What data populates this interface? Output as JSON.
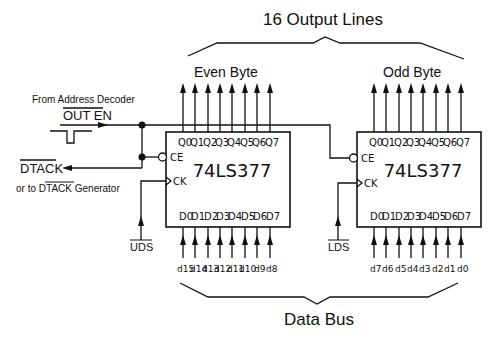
{
  "title": "16 Output Lines",
  "bottom_label": "Data Bus",
  "left_labels": {
    "source": "From Address Decoder",
    "out_en": "OUT EN",
    "dtack": "DTACK",
    "dtack_alt_prefix": "or to ",
    "dtack_alt_signal": "DTACK",
    "dtack_alt_suffix": " Generator"
  },
  "chips": [
    {
      "group_label": "Even Byte",
      "part": "74LS377",
      "ce_label": "CE",
      "ck_label": "CK",
      "clock_signal": "UDS",
      "outputs": [
        "Q0",
        "Q1",
        "Q2",
        "Q3",
        "Q4",
        "Q5",
        "Q6",
        "Q7"
      ],
      "inputs": [
        "D0",
        "D1",
        "D2",
        "D3",
        "D4",
        "D5",
        "D6",
        "D7"
      ],
      "bus_lines": [
        "d15",
        "d14",
        "d13",
        "d12",
        "d11",
        "d10",
        "d9",
        "d8"
      ]
    },
    {
      "group_label": "Odd Byte",
      "part": "74LS377",
      "ce_label": "CE",
      "ck_label": "CK",
      "clock_signal": "LDS",
      "outputs": [
        "Q0",
        "Q1",
        "Q2",
        "Q3",
        "Q4",
        "Q5",
        "Q6",
        "Q7"
      ],
      "inputs": [
        "D0",
        "D1",
        "D2",
        "D3",
        "D4",
        "D5",
        "D6",
        "D7"
      ],
      "bus_lines": [
        "d7",
        "d6",
        "d5",
        "d4",
        "d3",
        "d2",
        "d1",
        "d0"
      ]
    }
  ]
}
